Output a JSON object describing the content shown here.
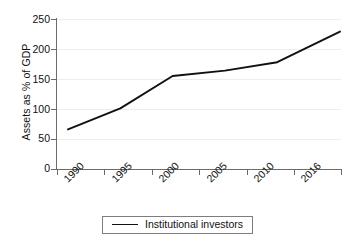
{
  "chart_data": {
    "type": "line",
    "title": "",
    "xlabel": "",
    "ylabel": "Assets as % of GDP",
    "categories": [
      "1990",
      "1995",
      "2000",
      "2005",
      "2010",
      "2016"
    ],
    "x": [
      1990,
      1995,
      2000,
      2005,
      2010,
      2016
    ],
    "series": [
      {
        "name": "Institutional investors",
        "values": [
          66,
          101,
          155,
          164,
          178,
          229
        ],
        "color": "#111111"
      }
    ],
    "ylim": [
      0,
      250
    ],
    "yticks": [
      0,
      50,
      100,
      150,
      200,
      250
    ],
    "ytick_labels": [
      "0",
      "50",
      "100",
      "150",
      "200",
      "250"
    ],
    "grid": true,
    "grid_axis": "y",
    "grid_color": "#ededed",
    "axis_color": "#6b6b6b",
    "background": "#ffffff",
    "legend": {
      "position": "bottom",
      "bordered": true,
      "entries": [
        {
          "label": "Institutional investors",
          "color": "#111111"
        }
      ]
    }
  }
}
